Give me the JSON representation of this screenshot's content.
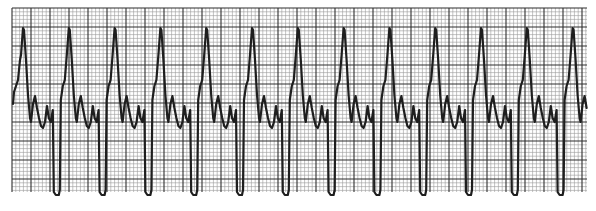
{
  "figure": {
    "type": "ecg-rhythm-strip",
    "beat_count": 13
  },
  "colors": {
    "background": "#ffffff",
    "grid_minor": "#9a9a9a",
    "grid_major": "#2e2e2e",
    "trace": "#1e1e1e"
  },
  "grid": {
    "left": 12,
    "top": 8,
    "right": 587,
    "bottom": 192,
    "minor_px": 3.8,
    "major_every": 5
  },
  "trace": {
    "first_peak_x": 23,
    "beat_spacing_px": 45.8,
    "peak_y": 28,
    "baseline_y": 100,
    "nadir_y": 194
  }
}
